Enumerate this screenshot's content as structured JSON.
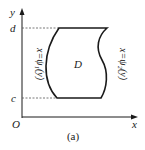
{
  "figure": {
    "caption": "(a)",
    "axes": {
      "x_label": "x",
      "y_label": "y",
      "origin_label": "O"
    },
    "levels": {
      "top": "d",
      "bottom": "c"
    },
    "region_label": "D",
    "left_boundary": "x=ψ₁(y)",
    "right_boundary": "x=ψ₂(y)"
  },
  "colors": {
    "ink": "#1a1a1a",
    "dashed": "#555555"
  }
}
